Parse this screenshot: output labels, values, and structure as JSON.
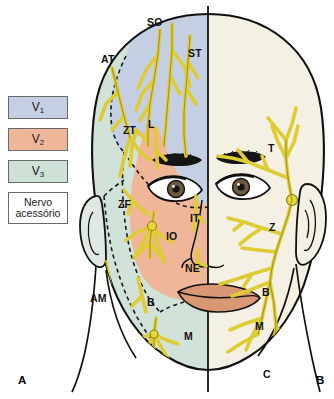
{
  "figure": {
    "title_a": "A",
    "title_b": "B"
  },
  "legend": {
    "items": [
      {
        "key": "v1",
        "label": "V",
        "sub": "1",
        "color": "#c5cfe4",
        "name": "legend-v1"
      },
      {
        "key": "v2",
        "label": "V",
        "sub": "2",
        "color": "#efb79a",
        "name": "legend-v2"
      },
      {
        "key": "v3",
        "label": "V",
        "sub": "3",
        "color": "#cfe0d6",
        "name": "legend-v3"
      },
      {
        "key": "accessory",
        "label": "Nervo",
        "label2": "acessório",
        "color": "#ffffff",
        "name": "legend-nervo-acessorio"
      }
    ]
  },
  "labels_left": [
    {
      "id": "SO",
      "text": "SO",
      "x": 147,
      "y": 16
    },
    {
      "id": "AT",
      "text": "AT",
      "x": 101,
      "y": 53
    },
    {
      "id": "ST",
      "text": "ST",
      "x": 188,
      "y": 47
    },
    {
      "id": "ZT",
      "text": "ZT",
      "x": 123,
      "y": 124
    },
    {
      "id": "L",
      "text": "L",
      "x": 148,
      "y": 118
    },
    {
      "id": "ZF",
      "text": "ZF",
      "x": 118,
      "y": 198
    },
    {
      "id": "IT",
      "text": "IT",
      "x": 190,
      "y": 212
    },
    {
      "id": "IO",
      "text": "IO",
      "x": 166,
      "y": 230
    },
    {
      "id": "NE",
      "text": "NE",
      "x": 185,
      "y": 262
    },
    {
      "id": "AM",
      "text": "AM",
      "x": 90,
      "y": 292
    },
    {
      "id": "B",
      "text": "B",
      "x": 147,
      "y": 296
    },
    {
      "id": "M",
      "text": "M",
      "x": 184,
      "y": 330
    }
  ],
  "labels_right": [
    {
      "id": "T",
      "text": "T",
      "x": 268,
      "y": 142
    },
    {
      "id": "Z",
      "text": "Z",
      "x": 269,
      "y": 221
    },
    {
      "id": "B",
      "text": "B",
      "x": 262,
      "y": 286
    },
    {
      "id": "M",
      "text": "M",
      "x": 255,
      "y": 320
    },
    {
      "id": "C",
      "text": "C",
      "x": 263,
      "y": 368
    }
  ],
  "colors": {
    "v1_region": "#c5cfe4",
    "v2_region": "#efb79a",
    "v3_region": "#cfe0d6",
    "right_face": "#f4f1e4",
    "nerve_yellow": "#e8d53a",
    "nerve_outline": "#9a8f1e",
    "skin_outline": "#000000",
    "lip": "#d89874",
    "background": "#ffffff"
  }
}
